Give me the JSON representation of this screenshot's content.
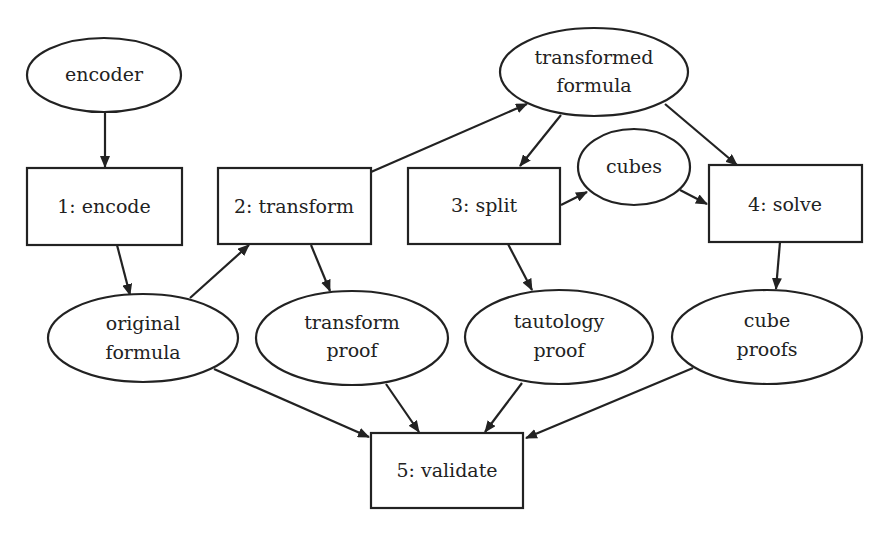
{
  "diagram": {
    "type": "flowchart",
    "nodes": [
      {
        "id": "encoder",
        "shape": "ellipse",
        "lines": [
          "encoder"
        ]
      },
      {
        "id": "encode",
        "shape": "rect",
        "lines": [
          "1: encode"
        ]
      },
      {
        "id": "transform",
        "shape": "rect",
        "lines": [
          "2: transform"
        ]
      },
      {
        "id": "split",
        "shape": "rect",
        "lines": [
          "3: split"
        ]
      },
      {
        "id": "solve",
        "shape": "rect",
        "lines": [
          "4: solve"
        ]
      },
      {
        "id": "validate",
        "shape": "rect",
        "lines": [
          "5: validate"
        ]
      },
      {
        "id": "transformed_formula",
        "shape": "ellipse",
        "lines": [
          "transformed",
          "formula"
        ]
      },
      {
        "id": "cubes",
        "shape": "ellipse",
        "lines": [
          "cubes"
        ]
      },
      {
        "id": "original_formula",
        "shape": "ellipse",
        "lines": [
          "original",
          "formula"
        ]
      },
      {
        "id": "transform_proof",
        "shape": "ellipse",
        "lines": [
          "transform",
          "proof"
        ]
      },
      {
        "id": "tautology_proof",
        "shape": "ellipse",
        "lines": [
          "tautology",
          "proof"
        ]
      },
      {
        "id": "cube_proofs",
        "shape": "ellipse",
        "lines": [
          "cube",
          "proofs"
        ]
      }
    ],
    "edges": [
      {
        "from": "encoder",
        "to": "encode"
      },
      {
        "from": "encode",
        "to": "original_formula"
      },
      {
        "from": "original_formula",
        "to": "transform"
      },
      {
        "from": "transform",
        "to": "transformed_formula"
      },
      {
        "from": "transform",
        "to": "transform_proof"
      },
      {
        "from": "transformed_formula",
        "to": "split"
      },
      {
        "from": "transformed_formula",
        "to": "solve"
      },
      {
        "from": "split",
        "to": "cubes"
      },
      {
        "from": "cubes",
        "to": "solve"
      },
      {
        "from": "split",
        "to": "tautology_proof"
      },
      {
        "from": "solve",
        "to": "cube_proofs"
      },
      {
        "from": "original_formula",
        "to": "validate"
      },
      {
        "from": "transform_proof",
        "to": "validate"
      },
      {
        "from": "tautology_proof",
        "to": "validate"
      },
      {
        "from": "cube_proofs",
        "to": "validate"
      }
    ]
  },
  "labels": {
    "encoder": "encoder",
    "encode": "1: encode",
    "transform": "2: transform",
    "split": "3: split",
    "solve": "4: solve",
    "validate": "5: validate",
    "transformed_formula_1": "transformed",
    "transformed_formula_2": "formula",
    "cubes": "cubes",
    "original_formula_1": "original",
    "original_formula_2": "formula",
    "transform_proof_1": "transform",
    "transform_proof_2": "proof",
    "tautology_proof_1": "tautology",
    "tautology_proof_2": "proof",
    "cube_proofs_1": "cube",
    "cube_proofs_2": "proofs"
  },
  "colors": {
    "stroke": "#222222",
    "background": "#ffffff"
  }
}
